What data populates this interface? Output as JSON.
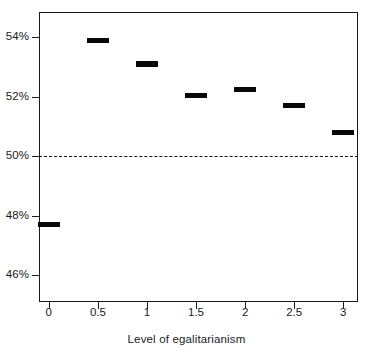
{
  "chart_data": {
    "type": "scatter",
    "title": "",
    "subtitle": "",
    "xlabel": "Level of egalitarianism",
    "ylabel": "",
    "x": [
      0,
      0.5,
      1,
      1.5,
      2,
      2.5,
      3
    ],
    "categories": [
      "0",
      "0.5",
      "1",
      "1.5",
      "2",
      "2.5",
      "3"
    ],
    "values": [
      47.7,
      53.9,
      53.1,
      52.05,
      52.25,
      51.7,
      50.8
    ],
    "series": [
      {
        "name": "Predicted share",
        "values": [
          47.7,
          53.9,
          53.1,
          52.05,
          52.25,
          51.7,
          50.8
        ]
      }
    ],
    "xlim": [
      -0.1,
      3.15
    ],
    "ylim": [
      45.1,
      54.85
    ],
    "x_ticks": [
      0,
      0.5,
      1,
      1.5,
      2,
      2.5,
      3
    ],
    "x_tick_labels": [
      "0",
      "0.5",
      "1",
      "1.5",
      "2",
      "2.5",
      "3"
    ],
    "y_ticks": [
      46,
      48,
      50,
      52,
      54
    ],
    "y_tick_labels": [
      "46%",
      "48%",
      "50%",
      "52%",
      "54%"
    ],
    "grid": false,
    "legend": null,
    "annotations": [
      {
        "type": "reference-line",
        "orientation": "horizontal",
        "value": 50,
        "style": "dashed",
        "label": "50%"
      }
    ],
    "marker": {
      "shape": "horizontal-bar",
      "color": "#080808",
      "width_data_units": 0.22,
      "thickness_px": 5.5
    }
  },
  "axes": {
    "x": {
      "title": "Level of egalitarianism",
      "ticks": [
        {
          "value": 0,
          "label": "0"
        },
        {
          "value": 0.5,
          "label": "0.5"
        },
        {
          "value": 1,
          "label": "1"
        },
        {
          "value": 1.5,
          "label": "1.5"
        },
        {
          "value": 2,
          "label": "2"
        },
        {
          "value": 2.5,
          "label": "2.5"
        },
        {
          "value": 3,
          "label": "3"
        }
      ]
    },
    "y": {
      "title": "",
      "ticks": [
        {
          "value": 54,
          "label": "54%"
        },
        {
          "value": 52,
          "label": "52%"
        },
        {
          "value": 50,
          "label": "50%"
        },
        {
          "value": 48,
          "label": "48%"
        },
        {
          "value": 46,
          "label": "46%"
        }
      ]
    }
  },
  "colors": {
    "axis": "#1a1a1a",
    "marker": "#080808",
    "reference_line": "#111111",
    "background": "#ffffff",
    "text": "#1a1a1a"
  }
}
